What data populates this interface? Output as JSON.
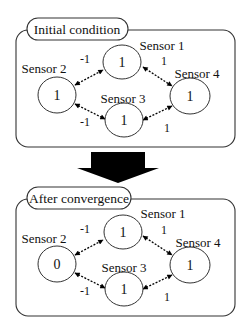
{
  "panels": [
    {
      "title": "Initial condition",
      "sensors": [
        {
          "name": "Sensor 1",
          "value": "1"
        },
        {
          "name": "Sensor 2",
          "value": "1"
        },
        {
          "name": "Sensor 3",
          "value": "1"
        },
        {
          "name": "Sensor 4",
          "value": "1"
        }
      ],
      "edges": [
        {
          "from": "Sensor 2",
          "to": "Sensor 1",
          "weight": "-1"
        },
        {
          "from": "Sensor 1",
          "to": "Sensor 4",
          "weight": "1"
        },
        {
          "from": "Sensor 2",
          "to": "Sensor 3",
          "weight": "-1"
        },
        {
          "from": "Sensor 3",
          "to": "Sensor 4",
          "weight": "1"
        }
      ]
    },
    {
      "title": "After convergence",
      "sensors": [
        {
          "name": "Sensor 1",
          "value": "1"
        },
        {
          "name": "Sensor 2",
          "value": "0"
        },
        {
          "name": "Sensor 3",
          "value": "1"
        },
        {
          "name": "Sensor 4",
          "value": "1"
        }
      ],
      "edges": [
        {
          "from": "Sensor 2",
          "to": "Sensor 1",
          "weight": "-1"
        },
        {
          "from": "Sensor 1",
          "to": "Sensor 4",
          "weight": "1"
        },
        {
          "from": "Sensor 2",
          "to": "Sensor 3",
          "weight": "-1"
        },
        {
          "from": "Sensor 3",
          "to": "Sensor 4",
          "weight": "1"
        }
      ]
    }
  ],
  "transition_arrow": {
    "direction": "down",
    "color": "#000000"
  }
}
